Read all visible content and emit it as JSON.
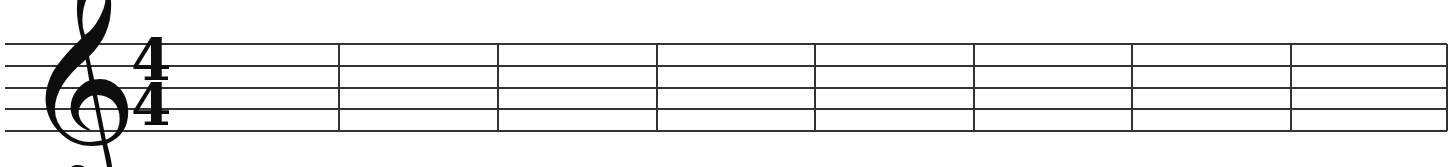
{
  "sheet": {
    "title": "Blank music staff",
    "type": "staff-notation",
    "background_color": "#ffffff",
    "ink_color": "#333333",
    "glyph_color": "#0d0d0d",
    "width": 1454,
    "height": 167
  },
  "staff": {
    "line_count": 5,
    "line_thickness": 2,
    "line_y": [
      44,
      66,
      88,
      109,
      131
    ],
    "start_x": 5,
    "end_x": 1447,
    "label": "5-line staff"
  },
  "clef": {
    "name": "treble-clef",
    "glyph": "𝄞",
    "label": "Treble clef (G clef)",
    "x": 22,
    "y": 8
  },
  "time_signature": {
    "name": "common-time",
    "numerator": "4",
    "denominator": "4",
    "label": "4/4",
    "x": 131
  },
  "barlines": {
    "label": "Barlines",
    "thickness": 2,
    "x_positions": [
      339,
      498,
      657,
      815,
      974,
      1132,
      1291,
      1447
    ]
  },
  "measures": {
    "count": 8,
    "label": "Empty measures",
    "notes": []
  }
}
